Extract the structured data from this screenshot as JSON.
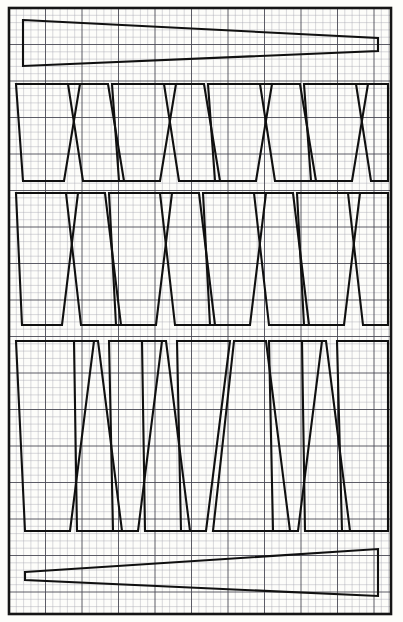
{
  "document": {
    "title": "Nested Tapered Panel Cutting Layout",
    "medium": "graph-paper-technical-drawing",
    "background_color": "#fdfdfb",
    "ink_color": "#101010",
    "grid_minor_color": "#a9a9b4",
    "grid_major_color": "#4a4a55"
  },
  "canvas": {
    "width": 403,
    "height": 622
  },
  "grid": {
    "minor_spacing_px": 7.3,
    "major_every_n_cells": 5,
    "major_spacing_px": 36.5,
    "origin_x": 9,
    "origin_y": 8,
    "grid_right": 391,
    "grid_bottom": 614,
    "minor_stroke_width": 0.45,
    "major_stroke_width": 0.9
  },
  "border": {
    "x": 9,
    "y": 8,
    "width": 382,
    "height": 606,
    "stroke_width": 2.6,
    "color": "#151515"
  },
  "layout": {
    "bands": [
      {
        "name": "top-wedge-strip",
        "kind": "single-long-wedge",
        "y_top": 18,
        "y_bottom": 67,
        "piece_count": 1
      },
      {
        "name": "gore-band-1",
        "kind": "nested-trapezoid-row",
        "y_top": 83,
        "y_bottom": 181,
        "piece_count": 9
      },
      {
        "name": "gore-band-2",
        "kind": "nested-trapezoid-row",
        "y_top": 192,
        "y_bottom": 326,
        "piece_count": 8
      },
      {
        "name": "gore-band-3",
        "kind": "nested-trapezoid-row",
        "y_top": 340,
        "y_bottom": 532,
        "piece_count": 8
      },
      {
        "name": "bottom-wedge-strip",
        "kind": "single-long-wedge",
        "y_top": 548,
        "y_bottom": 597,
        "piece_count": 1
      }
    ]
  },
  "pieces": [
    {
      "id": "top-wedge",
      "band": "top-wedge-strip",
      "orientation": "horizontal-taper-right",
      "points": "23,20 378,38 378,51 23,66"
    },
    {
      "id": "b1-p1",
      "band": "gore-band-1",
      "orientation": "trapezoid-down",
      "points": "16,84 80,84 64,181 23,181"
    },
    {
      "id": "b1-p2",
      "band": "gore-band-1",
      "orientation": "trapezoid-up",
      "points": "83,181 124,181 108,84 68,84"
    },
    {
      "id": "b1-p3",
      "band": "gore-band-1",
      "orientation": "trapezoid-down",
      "points": "112,84 176,84 160,181 119,181"
    },
    {
      "id": "b1-p4",
      "band": "gore-band-1",
      "orientation": "trapezoid-up",
      "points": "179,181 220,181 204,84 164,84"
    },
    {
      "id": "b1-p5",
      "band": "gore-band-1",
      "orientation": "trapezoid-down",
      "points": "208,84 272,84 256,181 215,181"
    },
    {
      "id": "b1-p6",
      "band": "gore-band-1",
      "orientation": "trapezoid-up",
      "points": "275,181 316,181 300,84 260,84"
    },
    {
      "id": "b1-p7",
      "band": "gore-band-1",
      "orientation": "trapezoid-down",
      "points": "304,84 368,84 352,181 311,181"
    },
    {
      "id": "b1-p8",
      "band": "gore-band-1",
      "orientation": "trapezoid-up-partial",
      "points": "371,181 388,181 388,84 356,84"
    },
    {
      "id": "b2-p1",
      "band": "gore-band-2",
      "orientation": "trapezoid-down",
      "points": "16,193 78,193 62,325 22,325"
    },
    {
      "id": "b2-p2",
      "band": "gore-band-2",
      "orientation": "trapezoid-up",
      "points": "81,325 121,325 105,193 66,193"
    },
    {
      "id": "b2-p3",
      "band": "gore-band-2",
      "orientation": "trapezoid-down",
      "points": "109,193 172,193 156,325 116,325"
    },
    {
      "id": "b2-p4",
      "band": "gore-band-2",
      "orientation": "trapezoid-up",
      "points": "175,325 215,325 199,193 160,193"
    },
    {
      "id": "b2-p5",
      "band": "gore-band-2",
      "orientation": "trapezoid-down",
      "points": "203,193 266,193 250,325 210,325"
    },
    {
      "id": "b2-p6",
      "band": "gore-band-2",
      "orientation": "trapezoid-up",
      "points": "269,325 309,325 293,193 254,193"
    },
    {
      "id": "b2-p7",
      "band": "gore-band-2",
      "orientation": "trapezoid-down",
      "points": "297,193 360,193 344,325 304,325"
    },
    {
      "id": "b2-p8",
      "band": "gore-band-2",
      "orientation": "trapezoid-up-partial",
      "points": "363,325 388,325 388,193 348,193"
    },
    {
      "id": "b3-p1",
      "band": "gore-band-3",
      "orientation": "trapezoid-down",
      "points": "16,341 94,341 70,531 25,531"
    },
    {
      "id": "b3-p2",
      "band": "gore-band-3",
      "orientation": "trapezoid-up",
      "points": "77,531 122,531 98,341 74,341"
    },
    {
      "id": "b3-p3",
      "band": "gore-band-3",
      "orientation": "trapezoid-down",
      "points": "109,341 162,341 138,531 113,531"
    },
    {
      "id": "b3-p4",
      "band": "gore-band-3",
      "orientation": "trapezoid-up",
      "points": "145,531 190,531 166,341 142,341"
    },
    {
      "id": "b3-p5",
      "band": "gore-band-3",
      "orientation": "trapezoid-down",
      "points": "177,341 230,341 206,531 181,531"
    },
    {
      "id": "b3-p6",
      "band": "gore-band-3",
      "orientation": "trapezoid-up",
      "points": "213,531 290,531 266,341 234,341"
    },
    {
      "id": "b3-p7",
      "band": "gore-band-3",
      "orientation": "trapezoid-down",
      "points": "269,341 322,341 298,531 273,531"
    },
    {
      "id": "b3-p8",
      "band": "gore-band-3",
      "orientation": "trapezoid-up-partial",
      "points": "305,531 350,531 326,341 302,341"
    },
    {
      "id": "b3-p9",
      "band": "gore-band-3",
      "orientation": "trapezoid-down-edge",
      "points": "337,341 388,341 388,531 342,531"
    },
    {
      "id": "bottom-wedge",
      "band": "bottom-wedge-strip",
      "orientation": "horizontal-taper-left",
      "points": "25,572 378,549 378,596 25,580"
    }
  ]
}
